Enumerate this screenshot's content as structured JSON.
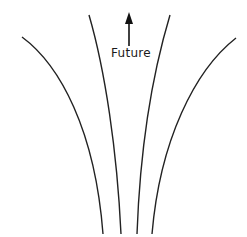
{
  "diagram": {
    "arrow_label": "Future",
    "stroke_color": "#222222",
    "curves": [
      {
        "name": "outer-left-curve",
        "path": "M22,37 C60,65 95,130 103,234"
      },
      {
        "name": "inner-left-curve",
        "path": "M89,15 C105,70 117,150 121,234"
      },
      {
        "name": "inner-right-curve",
        "path": "M170,15 C152,75 140,150 137,234"
      },
      {
        "name": "outer-right-curve",
        "path": "M236,38 C195,70 160,140 152,234"
      }
    ]
  }
}
